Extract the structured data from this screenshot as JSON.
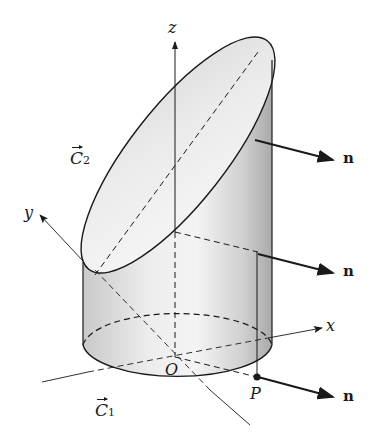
{
  "figure": {
    "axes": {
      "z_label": "z",
      "x_label": "x",
      "y_label": "y",
      "origin_label": "O"
    },
    "point_label": "P",
    "curves": {
      "c2_letter": "C",
      "c2_sub": "2",
      "c1_letter": "C",
      "c1_sub": "1"
    },
    "normals": [
      {
        "label": "n"
      },
      {
        "label": "n"
      },
      {
        "label": "n"
      }
    ],
    "colors": {
      "stroke": "#1a1a1a",
      "surface_light": "#f0f0f0",
      "surface_dark": "#bdbdbd",
      "background": "#ffffff"
    }
  }
}
